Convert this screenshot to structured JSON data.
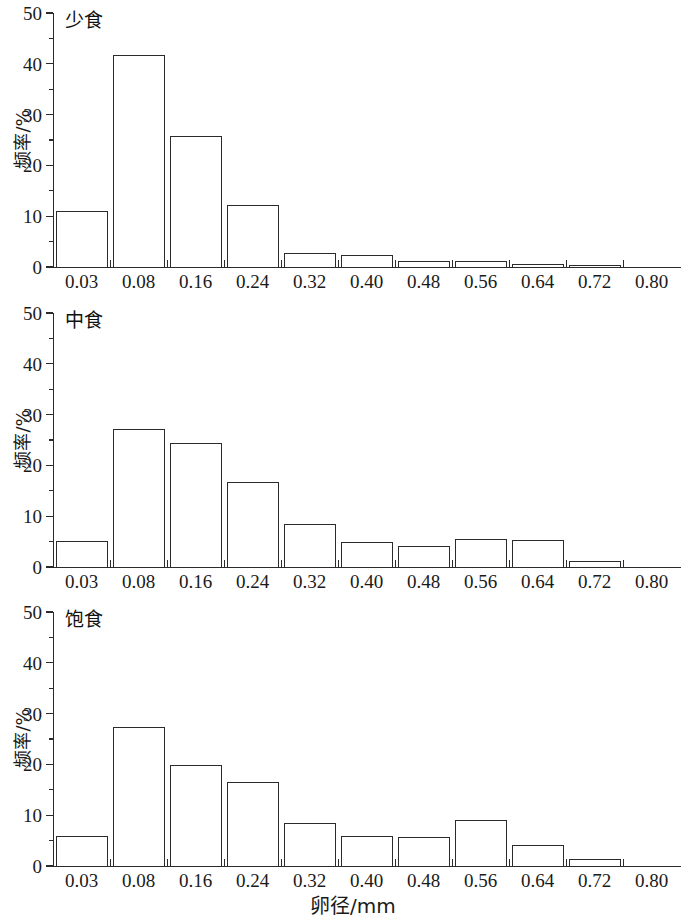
{
  "figure": {
    "xlabel": "卵径/mm",
    "ylabel": "频率/%"
  },
  "panels": [
    {
      "title": "少食"
    },
    {
      "title": "中食"
    },
    {
      "title": "饱食"
    }
  ],
  "axis": {
    "y_ticks": [
      "0",
      "10",
      "20",
      "30",
      "40",
      "50"
    ],
    "x_ticks": [
      "0.03",
      "0.08",
      "0.16",
      "0.24",
      "0.32",
      "0.40",
      "0.48",
      "0.56",
      "0.64",
      "0.72",
      "0.80"
    ]
  },
  "chart_data": {
    "type": "bar",
    "title": "",
    "xlabel": "卵径/mm",
    "ylabel": "频率/%",
    "categories": [
      "0.03",
      "0.08",
      "0.16",
      "0.24",
      "0.32",
      "0.40",
      "0.48",
      "0.56",
      "0.64",
      "0.72",
      "0.80"
    ],
    "ylim": [
      0,
      50
    ],
    "y_major_step": 10,
    "y_minor_step": 5,
    "grid": false,
    "legend": "none",
    "panels": [
      {
        "name": "少食",
        "values": [
          11.0,
          41.8,
          25.8,
          12.3,
          2.8,
          2.3,
          1.1,
          1.1,
          0.6,
          0.1,
          0.0
        ]
      },
      {
        "name": "中食",
        "values": [
          5.2,
          27.1,
          24.5,
          16.7,
          8.5,
          4.9,
          4.2,
          5.5,
          5.3,
          1.2,
          0.0
        ]
      },
      {
        "name": "饱食",
        "values": [
          5.9,
          27.3,
          19.8,
          16.6,
          8.5,
          6.0,
          5.7,
          9.0,
          4.2,
          1.4,
          0.0
        ]
      }
    ]
  }
}
